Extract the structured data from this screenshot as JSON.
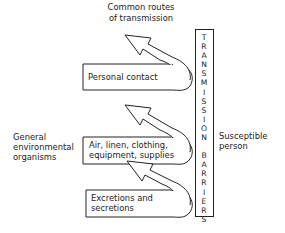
{
  "diagram": {
    "title_lines": [
      "Common routes",
      "of transmission"
    ],
    "left_label_lines": [
      "General",
      "environmental",
      "organisms"
    ],
    "right_label_lines": [
      "Susceptible",
      "person"
    ],
    "barrier": {
      "label": "TRANSMISSION BARRIERS",
      "letters": [
        "T",
        "R",
        "A",
        "N",
        "S",
        "M",
        "I",
        "S",
        "S",
        "I",
        "O",
        "N",
        " ",
        "B",
        "A",
        "R",
        "R",
        "I",
        "E",
        "R",
        "S"
      ]
    },
    "routes": [
      {
        "id": "personal-contact",
        "lines": [
          "Personal contact"
        ]
      },
      {
        "id": "air-linen",
        "lines": [
          "Air, linen, clothing,",
          "equipment, supplies"
        ]
      },
      {
        "id": "excretions",
        "lines": [
          "Excretions and",
          "secretions"
        ]
      }
    ],
    "colors": {
      "line": "#222222",
      "background": "#ffffff"
    }
  }
}
